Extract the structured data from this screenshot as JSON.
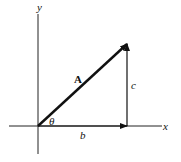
{
  "diagram": {
    "axes": {
      "x_label": "x",
      "y_label": "y"
    },
    "vector": {
      "label": "A",
      "angle_label": "θ"
    },
    "components": {
      "horizontal_label": "b",
      "vertical_label": "c"
    },
    "colors": {
      "ink": "#111111",
      "background": "#ffffff"
    }
  }
}
